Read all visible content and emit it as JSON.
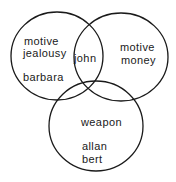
{
  "diagram": {
    "type": "venn",
    "sets": [
      {
        "id": "jealousy",
        "title_lines": [
          "motive",
          "jealousy"
        ],
        "members": [
          "barbara"
        ]
      },
      {
        "id": "money",
        "title_lines": [
          "motive",
          "money"
        ],
        "members": []
      },
      {
        "id": "weapon",
        "title_lines": [
          "weapon"
        ],
        "members": [
          "allan",
          "bert"
        ]
      }
    ],
    "intersections": [
      {
        "sets": [
          "jealousy",
          "money"
        ],
        "members": [
          "john"
        ]
      }
    ],
    "colors": {
      "stroke": "#1a1a1a",
      "text": "#1a1a1a",
      "background": "#ffffff"
    }
  }
}
